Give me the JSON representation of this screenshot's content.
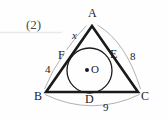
{
  "figure": {
    "problem_index": "(2)",
    "background_color": "#fefefe",
    "stroke_color": "#1a1a1a",
    "thin_stroke_color": "#9a9a9a",
    "rule_line_color": "#e8e8ec",
    "type": "geometry-diagram"
  },
  "labels": {
    "vertex_a": "A",
    "vertex_b": "B",
    "vertex_c": "C",
    "point_d": "D",
    "point_e": "E",
    "point_f": "F",
    "center_o": "O",
    "unknown_x": "x",
    "len_fb": "4",
    "len_ec": "8",
    "len_bc": "9"
  },
  "geometry": {
    "vertices": {
      "A": [
        92,
        26
      ],
      "B": [
        46,
        92
      ],
      "C": [
        138,
        92
      ]
    },
    "incircle": {
      "center": [
        89.5,
        70.5
      ],
      "radius": 22.5,
      "center_dot_radius": 2
    },
    "tangent_points": {
      "D": [
        89.5,
        93
      ],
      "E": [
        114,
        57
      ],
      "F": [
        69,
        56
      ]
    }
  },
  "measures": {
    "AF_equals": "x",
    "FB": "4",
    "EC": "8",
    "BC": "9"
  }
}
